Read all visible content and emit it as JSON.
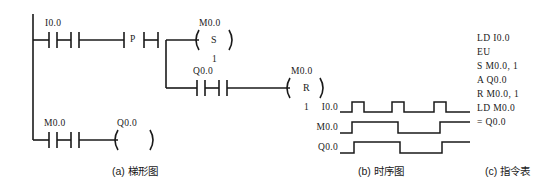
{
  "figure": {
    "panels": [
      {
        "id": "a",
        "caption": "(a) 梯形图"
      },
      {
        "id": "b",
        "caption": "(b) 时序图"
      },
      {
        "id": "c",
        "caption": "(c) 指令表"
      }
    ],
    "line_color": "#1a1a1a"
  },
  "ladder": {
    "rungs": [
      {
        "id": "rung-1",
        "elements": [
          {
            "kind": "contact-no",
            "label": "I0.0"
          },
          {
            "kind": "contact-no",
            "label": ""
          },
          {
            "kind": "transition-positive",
            "label": "P"
          },
          {
            "kind": "contact-no",
            "label": ""
          },
          {
            "kind": "coil-set",
            "label": "M0.0",
            "letter": "S",
            "count": "1"
          }
        ]
      },
      {
        "id": "rung-2-branch",
        "elements": [
          {
            "kind": "contact-no",
            "label": "Q0.0"
          },
          {
            "kind": "contact-no",
            "label": ""
          },
          {
            "kind": "coil-reset",
            "label": "M0.0",
            "letter": "R",
            "count": "1"
          }
        ]
      },
      {
        "id": "rung-3",
        "elements": [
          {
            "kind": "contact-no",
            "label": "M0.0"
          },
          {
            "kind": "contact-no",
            "label": ""
          },
          {
            "kind": "coil-output",
            "label": "Q0.0"
          }
        ]
      }
    ],
    "labels": {
      "i00": "I0.0",
      "m00_set": "M0.0",
      "set_letter": "S",
      "set_count": "1",
      "q00_contact": "Q0.0",
      "m00_reset": "M0.0",
      "reset_letter": "R",
      "reset_count": "1",
      "m00_contact": "M0.0",
      "q00_coil": "Q0.0",
      "p_letter": "P"
    }
  },
  "timing": {
    "signals": [
      {
        "name": "I0.0",
        "description": "input pulse train, three short pulses",
        "segments": [
          0,
          1,
          0,
          1,
          0,
          1,
          0
        ],
        "edges_px": [
          0,
          12,
          24,
          52,
          64,
          94,
          106,
          130
        ]
      },
      {
        "name": "M0.0",
        "description": "set/reset flip-flop toggling on rising edges",
        "segments": [
          0,
          1,
          0,
          1
        ],
        "edges_px": [
          0,
          12,
          58,
          100,
          130
        ]
      },
      {
        "name": "Q0.0",
        "description": "output follows M0.0",
        "segments": [
          0,
          1,
          0,
          1
        ],
        "edges_px": [
          0,
          14,
          60,
          102,
          130
        ]
      }
    ]
  },
  "instruction_list": {
    "lines": [
      "LD I0.0",
      "EU",
      "S M0.0, 1",
      "A Q0.0",
      "R M0.0, 1",
      "LD M0.0",
      "= Q0.0"
    ]
  }
}
